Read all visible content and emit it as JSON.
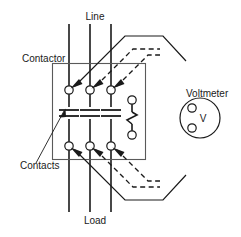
{
  "diagram": {
    "labels": {
      "line": "Line",
      "load": "Load",
      "contactor": "Contactor",
      "contacts": "Contacts",
      "voltmeter": "Voltmeter",
      "meter_symbol": "V"
    },
    "colors": {
      "wire": "#1a1a1a",
      "enclosure": "#5a5a5a",
      "background": "#ffffff"
    },
    "components": {
      "power_poles": 3,
      "auxiliary_contact": 1,
      "top_terminals": 3,
      "bottom_terminals": 3,
      "probe_leads_top": 3,
      "probe_leads_bottom": 3,
      "solid_leads": 2,
      "dashed_leads": 4
    }
  }
}
